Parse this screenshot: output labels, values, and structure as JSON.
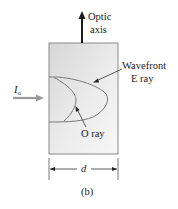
{
  "figure": {
    "caption": "(b)",
    "labels": {
      "optic_axis_line1": "Optic",
      "optic_axis_line2": "axis",
      "wavefront_line1": "Wavefront",
      "wavefront_line2": "E ray",
      "o_ray": "O ray",
      "incident": "I",
      "incident_sub": "o",
      "thickness": "d"
    },
    "colors": {
      "crystal_fill_light": "#f2f2f2",
      "crystal_fill_dark": "#d8d8d8",
      "crystal_border": "#8a8a8a",
      "curve": "#7a7a7a",
      "arrow": "#1a1a1a",
      "incident_arrow": "#9a9a9a",
      "text": "#222222"
    }
  }
}
